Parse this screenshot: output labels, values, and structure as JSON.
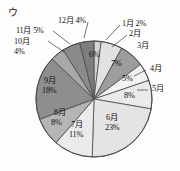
{
  "figure": {
    "label": "ウ",
    "label_name": "figure-label-u"
  },
  "chart_data": {
    "type": "pie",
    "title": "",
    "xlabel": "",
    "ylabel": "",
    "legend_position": "none",
    "grid": false,
    "start_angle_deg": 0,
    "direction": "clockwise",
    "categories": [
      "1月",
      "2月",
      "3月",
      "4月",
      "5月",
      "6月",
      "7月",
      "8月",
      "9月",
      "10月",
      "11月",
      "12月"
    ],
    "values": [
      2,
      6,
      7,
      5,
      8,
      23,
      11,
      8,
      18,
      4,
      5,
      4
    ],
    "unit": "%",
    "slices": [
      {
        "name": "1月",
        "value": 2,
        "value_text": "2%",
        "label_text": "1月 2%",
        "color": "#d5d5d5",
        "placement": "outside"
      },
      {
        "name": "2月",
        "value": 6,
        "value_text": "6%",
        "label_text": "2月",
        "color": "#e2e2e2",
        "placement": "outside-value-inside"
      },
      {
        "name": "3月",
        "value": 7,
        "value_text": "7%",
        "label_text": "3月",
        "color": "#9d9d9d",
        "placement": "outside-value-inside"
      },
      {
        "name": "4月",
        "value": 5,
        "value_text": "5%",
        "label_text": "4月",
        "color": "#f2f2f2",
        "placement": "outside-value-inside"
      },
      {
        "name": "5月",
        "value": 8,
        "value_text": "8%",
        "label_text": "5月",
        "color": "#eaeaea",
        "placement": "outside-value-inside"
      },
      {
        "name": "6月",
        "value": 23,
        "value_text": "23%",
        "label_text": "6月",
        "color": "#e4e4e4",
        "placement": "inside"
      },
      {
        "name": "7月",
        "value": 11,
        "value_text": "11%",
        "label_text": "7月",
        "color": "#ebebeb",
        "placement": "inside"
      },
      {
        "name": "8月",
        "value": 8,
        "value_text": "8%",
        "label_text": "8月",
        "color": "#b5b5b5",
        "placement": "inside"
      },
      {
        "name": "9月",
        "value": 18,
        "value_text": "18%",
        "label_text": "9月",
        "color": "#8e8e8e",
        "placement": "inside"
      },
      {
        "name": "10月",
        "value": 4,
        "value_text": "4%",
        "label_text": "10月",
        "color": "#a8a8a8",
        "placement": "outside"
      },
      {
        "name": "11月",
        "value": 5,
        "value_text": "5%",
        "label_text": "11月 5%",
        "color": "#8a8a8a",
        "placement": "outside"
      },
      {
        "name": "12月",
        "value": 4,
        "value_text": "4%",
        "label_text": "12月 4%",
        "color": "#7d7d7d",
        "placement": "outside"
      }
    ]
  },
  "labels": {
    "jan": "1月 2%",
    "feb": "2月",
    "feb_val": "6%",
    "mar": "3月",
    "mar_val": "7%",
    "apr": "4月",
    "apr_val": "5%",
    "may": "5月",
    "may_val": "8%",
    "jun": "6月",
    "jun_val": "23%",
    "jul": "7月",
    "jul_val": "11%",
    "aug": "8月",
    "aug_val": "8%",
    "sep": "9月",
    "sep_val": "18%",
    "oct": "10月",
    "oct_val": "4%",
    "nov": "11月 5%",
    "dec": "12月 4%"
  },
  "colors": {
    "outline": "#4a4a4a",
    "background": "#fdfdfd",
    "text": "#141414"
  }
}
